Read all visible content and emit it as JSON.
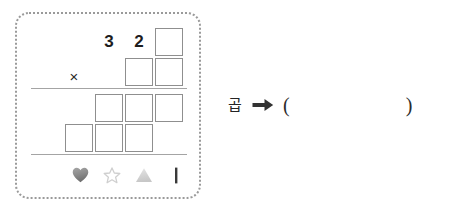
{
  "worksheet": {
    "panel_name": "dashed-worksheet-panel",
    "border_color": "#9a9a9a",
    "problem": {
      "type": "vertical-multiplication",
      "operator": "×",
      "multiplicand_row": {
        "label": "top-row",
        "cells": [
          {
            "kind": "digit",
            "value": "3"
          },
          {
            "kind": "digit",
            "value": "2"
          },
          {
            "kind": "box",
            "value": ""
          }
        ]
      },
      "multiplier_row": {
        "label": "second-row",
        "cells": [
          {
            "kind": "box",
            "value": ""
          },
          {
            "kind": "box",
            "value": ""
          }
        ]
      },
      "partial_product_row_1": {
        "label": "third-row",
        "cells": [
          {
            "kind": "box",
            "value": ""
          },
          {
            "kind": "box",
            "value": ""
          },
          {
            "kind": "box",
            "value": ""
          }
        ]
      },
      "partial_product_row_2": {
        "label": "fourth-row",
        "cells": [
          {
            "kind": "box",
            "value": ""
          },
          {
            "kind": "box",
            "value": ""
          },
          {
            "kind": "box",
            "value": ""
          }
        ]
      }
    },
    "legend": [
      {
        "icon": "heart-icon",
        "fill": "#8a8a8a",
        "style": "filled"
      },
      {
        "icon": "star-icon",
        "fill": "#cfcfcf",
        "style": "outline"
      },
      {
        "icon": "triangle-icon",
        "fill": "#d4d4d4",
        "style": "filled"
      },
      {
        "icon": "vertical-bar-icon",
        "fill": "#3a3a3a",
        "style": "filled"
      }
    ]
  },
  "answer": {
    "label": "곱",
    "arrow_icon": "right-arrow-icon",
    "open_paren": "(",
    "close_paren": ")"
  }
}
